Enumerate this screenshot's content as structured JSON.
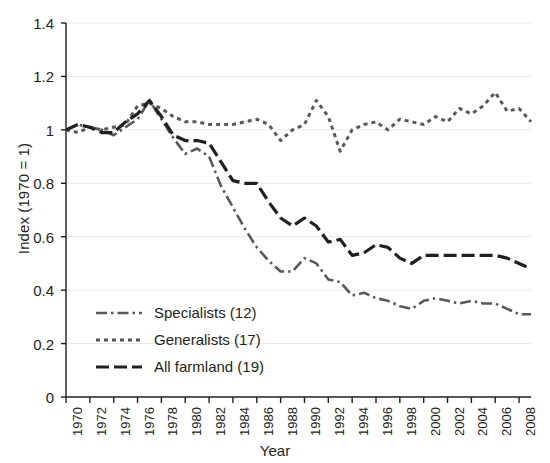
{
  "chart_data": {
    "type": "line",
    "title": "",
    "xlabel": "Year",
    "ylabel": "Index (1970 = 1)",
    "xlim": [
      1970,
      2009
    ],
    "ylim": [
      0,
      1.4
    ],
    "ytick_labels": [
      "0",
      "0.2",
      "0.4",
      "0.6",
      "0.8",
      "1",
      "1.2",
      "1.4"
    ],
    "ytick_values": [
      0,
      0.2,
      0.4,
      0.6,
      0.8,
      1,
      1.2,
      1.4
    ],
    "xtick_labels": [
      "1970",
      "1972",
      "1974",
      "1976",
      "1978",
      "1980",
      "1982",
      "1984",
      "1986",
      "1988",
      "1990",
      "1992",
      "1994",
      "1996",
      "1998",
      "2000",
      "2002",
      "2004",
      "2006",
      "2008"
    ],
    "xtick_values": [
      1970,
      1972,
      1974,
      1976,
      1978,
      1980,
      1982,
      1984,
      1986,
      1988,
      1990,
      1992,
      1994,
      1996,
      1998,
      2000,
      2002,
      2004,
      2006,
      2008
    ],
    "grid": "horizontal",
    "legend_position": "lower-left",
    "x": [
      1970,
      1971,
      1972,
      1973,
      1974,
      1975,
      1976,
      1977,
      1978,
      1979,
      1980,
      1981,
      1982,
      1983,
      1984,
      1985,
      1986,
      1987,
      1988,
      1989,
      1990,
      1991,
      1992,
      1993,
      1994,
      1995,
      1996,
      1997,
      1998,
      1999,
      2000,
      2001,
      2002,
      2003,
      2004,
      2005,
      2006,
      2007,
      2008,
      2009
    ],
    "series": [
      {
        "name": "Specialists (12)",
        "label": "Specialists (12)",
        "count": 12,
        "dash": "dash-dot",
        "color": "#58595b",
        "values": [
          1.0,
          1.02,
          1.01,
          1.0,
          0.98,
          1.01,
          1.04,
          1.11,
          1.04,
          0.97,
          0.91,
          0.93,
          0.9,
          0.79,
          0.71,
          0.63,
          0.56,
          0.51,
          0.47,
          0.47,
          0.52,
          0.5,
          0.44,
          0.43,
          0.38,
          0.39,
          0.37,
          0.36,
          0.34,
          0.33,
          0.36,
          0.37,
          0.36,
          0.35,
          0.36,
          0.35,
          0.35,
          0.33,
          0.31,
          0.31
        ]
      },
      {
        "name": "Generalists (17)",
        "label": "Generalists (17)",
        "count": 17,
        "dash": "dotted",
        "color": "#58595b",
        "values": [
          1.0,
          0.99,
          1.01,
          1.0,
          1.01,
          1.02,
          1.09,
          1.1,
          1.08,
          1.05,
          1.03,
          1.03,
          1.02,
          1.02,
          1.02,
          1.03,
          1.04,
          1.02,
          0.96,
          1.0,
          1.02,
          1.11,
          1.05,
          0.92,
          1.0,
          1.02,
          1.03,
          1.0,
          1.04,
          1.03,
          1.02,
          1.05,
          1.03,
          1.08,
          1.06,
          1.09,
          1.14,
          1.07,
          1.08,
          1.03
        ]
      },
      {
        "name": "All farmland (19)",
        "label": "All farmland (19)",
        "count": 19,
        "dash": "long-dash",
        "color": "#231f20",
        "values": [
          1.0,
          1.02,
          1.01,
          0.99,
          0.99,
          1.03,
          1.06,
          1.11,
          1.05,
          0.98,
          0.96,
          0.96,
          0.95,
          0.88,
          0.81,
          0.8,
          0.8,
          0.73,
          0.67,
          0.64,
          0.67,
          0.64,
          0.58,
          0.59,
          0.53,
          0.54,
          0.57,
          0.56,
          0.52,
          0.5,
          0.53,
          0.53,
          0.53,
          0.53,
          0.53,
          0.53,
          0.53,
          0.52,
          0.5,
          0.48
        ]
      }
    ]
  },
  "axes": {
    "x_axis_label": "Year",
    "y_axis_label": "Index (1970 = 1)"
  },
  "colors": {
    "axis": "#231f20",
    "grid": "#e9e9ec",
    "specialists": "#58595b",
    "generalists": "#58595b",
    "all_farmland": "#231f20",
    "background": "#ffffff"
  }
}
